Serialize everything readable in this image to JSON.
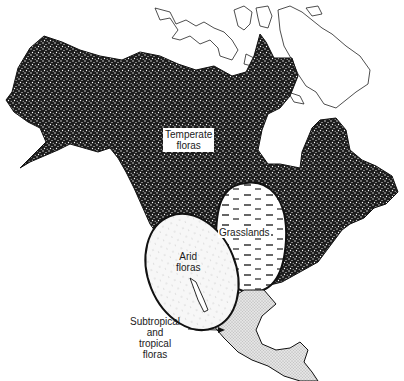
{
  "figure": {
    "regions": [
      {
        "id": "temperate",
        "label_line1": "Temperate",
        "label_line2": "floras",
        "pattern": "dense-black-stipple"
      },
      {
        "id": "grasslands",
        "label_line1": "Grasslands",
        "label_line2": "",
        "pattern": "dashed-tufts"
      },
      {
        "id": "arid",
        "label_line1": "Arid",
        "label_line2": "floras",
        "pattern": "light-sparse-dots"
      },
      {
        "id": "subtropical",
        "label_line1": "Subtropical",
        "label_line2": "and",
        "label_line3": "tropical",
        "label_line4": "floras",
        "pattern": "fine-grey-stipple"
      }
    ],
    "arctic_islands": {
      "pattern": "outline-only"
    },
    "colors": {
      "ink": "#111111",
      "background": "#ffffff",
      "subtropical_fill": "#d9d9d9"
    }
  }
}
